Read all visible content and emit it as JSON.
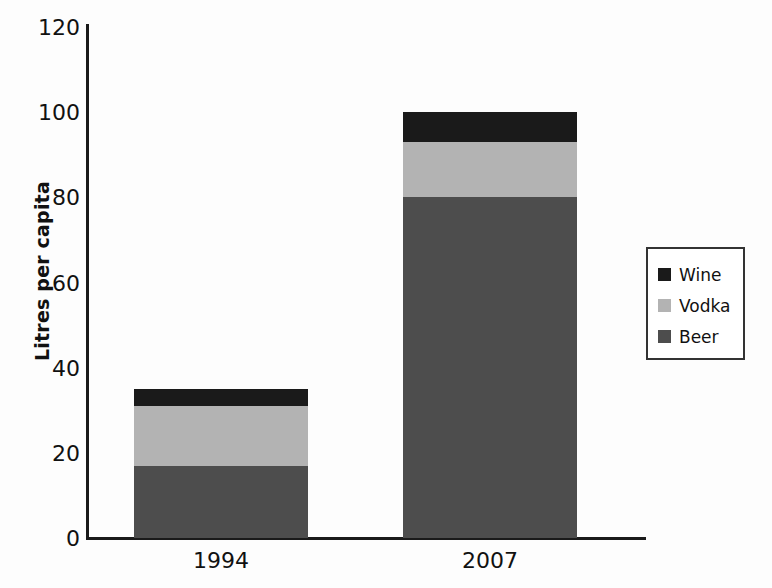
{
  "chart_data": {
    "type": "bar",
    "subtype": "stacked-column",
    "title": "",
    "xlabel": "",
    "ylabel": "Litres per capita",
    "categories": [
      "1994",
      "2007"
    ],
    "ylim": [
      0,
      120
    ],
    "yticks": [
      120,
      100,
      80,
      60,
      40,
      20,
      0
    ],
    "grid": false,
    "legend_position": "right",
    "series": [
      {
        "name": "Beer",
        "color": "#4d4d4d",
        "values": [
          17,
          80
        ]
      },
      {
        "name": "Vodka",
        "color": "#b3b3b3",
        "values": [
          14,
          13
        ]
      },
      {
        "name": "Wine",
        "color": "#1a1a1a",
        "values": [
          4,
          7
        ]
      }
    ],
    "totals": [
      35,
      100
    ],
    "stack_order_bottom_to_top": [
      "Beer",
      "Vodka",
      "Wine"
    ]
  },
  "axis": {
    "y_title": "Litres per capita",
    "y_ticks": [
      {
        "value": "120"
      },
      {
        "value": "100"
      },
      {
        "value": "80"
      },
      {
        "value": "60"
      },
      {
        "value": "40"
      },
      {
        "value": "20"
      },
      {
        "value": "0"
      }
    ],
    "x_ticks": [
      {
        "value": "1994"
      },
      {
        "value": "2007"
      }
    ]
  },
  "legend": {
    "items": [
      {
        "label": "Wine",
        "color": "#1a1a1a"
      },
      {
        "label": "Vodka",
        "color": "#b3b3b3"
      },
      {
        "label": "Beer",
        "color": "#4d4d4d"
      }
    ]
  }
}
